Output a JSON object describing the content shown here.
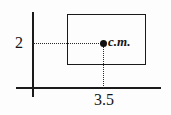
{
  "figure": {
    "background_color": "#fdfdfd",
    "line_color": "#1a1a1a",
    "width_px": 171,
    "height_px": 115
  },
  "axes": {
    "vertical": {
      "name": "y-axis",
      "x": 33,
      "y_top": 12,
      "y_bottom": 97
    },
    "horizontal": {
      "name": "x-axis",
      "y": 88,
      "x_left": 16,
      "x_right": 161
    }
  },
  "shape": {
    "type": "rectangle",
    "left": 67,
    "top": 14,
    "right": 146,
    "bottom": 65
  },
  "center_of_mass": {
    "label": "c.m.",
    "dot_x": 103,
    "dot_y": 43
  },
  "dimensions": {
    "height_label": "2",
    "width_label": "3.5"
  },
  "chart_data": {
    "type": "scatter",
    "xlabel": "",
    "ylabel": "",
    "annotations": [
      {
        "text": "2",
        "meaning": "vertical distance from x-axis to center of mass",
        "value": 2
      },
      {
        "text": "3.5",
        "meaning": "horizontal distance from y-axis to center of mass",
        "value": 3.5
      },
      {
        "text": "c.m.",
        "meaning": "center of mass marker label"
      }
    ],
    "points": [
      {
        "label": "c.m.",
        "x": 3.5,
        "y": 2
      }
    ],
    "shapes": [
      {
        "type": "rectangle",
        "x": 3.5,
        "y": 2,
        "note": "plate whose center of mass is marked"
      }
    ],
    "grid": false,
    "legend": false
  }
}
